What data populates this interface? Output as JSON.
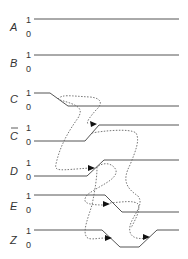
{
  "diagram": {
    "type": "timing-diagram",
    "level_high_label": "1",
    "level_low_label": "0",
    "signals": [
      {
        "name": "A",
        "overline": false,
        "description": "constant high"
      },
      {
        "name": "B",
        "overline": false,
        "description": "constant high"
      },
      {
        "name": "C",
        "overline": false,
        "description": "falls from 1 to 0"
      },
      {
        "name": "C",
        "overline": true,
        "description": "C-bar rises from 0 to 1"
      },
      {
        "name": "D",
        "overline": false,
        "description": "rises from 0 to 1"
      },
      {
        "name": "E",
        "overline": false,
        "description": "falls from 1 to 0"
      },
      {
        "name": "Z",
        "overline": false,
        "description": "falls from 1 to 0 then rises back to 1 (glitch)"
      }
    ],
    "causality_arrows": [
      {
        "from": "C fall",
        "to": "C-bar rise"
      },
      {
        "from": "C fall",
        "to": "D rise"
      },
      {
        "from": "C-bar rise",
        "to": "Z rise"
      },
      {
        "from": "D rise",
        "to": "E fall"
      },
      {
        "from": "D rise",
        "to": "Z fall"
      },
      {
        "from": "E fall",
        "to": "Z rise"
      }
    ],
    "colors": {
      "waveform": "#555555",
      "dotted_arrow": "#666666",
      "text": "#333333"
    }
  }
}
